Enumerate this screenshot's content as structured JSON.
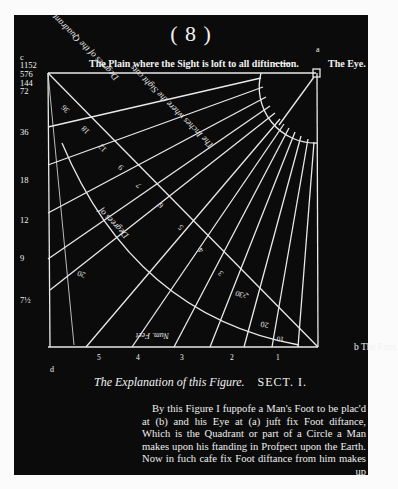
{
  "page": {
    "number": "( 8 )",
    "header_caption": "The Plain where the Sight is loft to all diftinction.",
    "header_dots": "-----",
    "eye_label": "The Eye.",
    "eye_point": "a",
    "foot_label": "b The Foot.",
    "corner_label": "c",
    "bottom_left_label": "d",
    "left_scale": [
      "1152",
      "576",
      "144",
      "72",
      "36",
      "18",
      "12",
      "9",
      "7½"
    ],
    "bottom_scale": [
      "5",
      "4",
      "3",
      "2",
      "1"
    ],
    "diagonal_numbers": [
      "288",
      "144",
      "72",
      "36",
      "18",
      "12",
      "9",
      "7",
      "6",
      "5",
      "4",
      "3",
      "2",
      "1"
    ],
    "arc_labels": [
      "90",
      "80",
      "70",
      "60",
      "50",
      "40",
      "30",
      "20",
      "10"
    ],
    "diagram_texts": [
      "Degrees of the Quadrant",
      "Number of Foot diftance",
      "The Inches where the Sight cuts",
      "Degrees of a Circle",
      "Num. Feet"
    ],
    "section_caption_italic": "The Explanation of this Figure.",
    "section_caption_title": "SECT. I.",
    "body_lines": [
      "By this Figure I fuppofe a Man's Foot to be plac'd",
      "at (b) and his Eye at (a) juft fix Foot diftance,",
      "Which is the Quadrant or part of a Circle a Man",
      "makes upon his ftanding in Profpect upon the Earth.",
      "Now in fuch cafe fix Foot diftance from him makes",
      "up"
    ]
  },
  "colors": {
    "paper": "#fbfbfb",
    "ink_background": "#0b0b0b",
    "lines": "#e9e9e9",
    "text": "#f2f2f2"
  }
}
